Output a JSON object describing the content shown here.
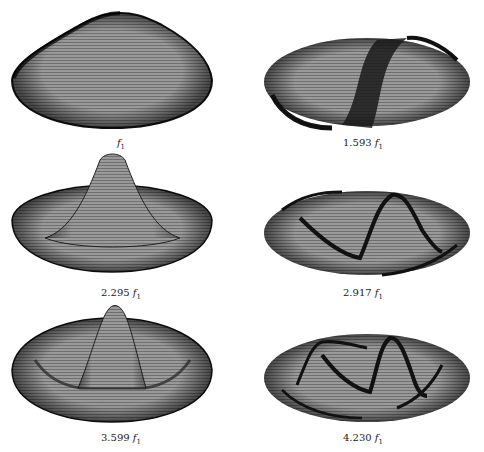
{
  "figure": {
    "modes": [
      {
        "coefficient": "",
        "unit": "f",
        "subscript": "1",
        "label": "f1"
      },
      {
        "coefficient": "1.593",
        "unit": "f",
        "subscript": "1",
        "label": "1.593 f1"
      },
      {
        "coefficient": "2.295",
        "unit": "f",
        "subscript": "1",
        "label": "2.295 f1"
      },
      {
        "coefficient": "2.917",
        "unit": "f",
        "subscript": "1",
        "label": "2.917 f1"
      },
      {
        "coefficient": "3.599",
        "unit": "f",
        "subscript": "1",
        "label": "3.599 f1"
      },
      {
        "coefficient": "4.230",
        "unit": "f",
        "subscript": "1",
        "label": "4.230 f1"
      }
    ]
  },
  "colors": {
    "mesh_fill": "#8a8a8a",
    "mesh_dark": "#1a1a1a",
    "background": "#ffffff"
  }
}
